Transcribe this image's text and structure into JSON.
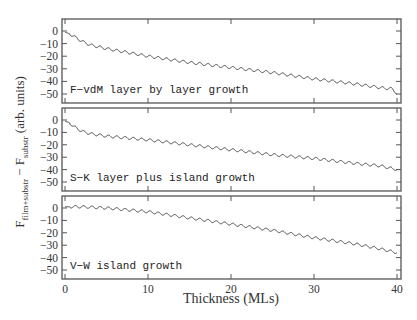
{
  "chart_data": {
    "type": "line",
    "layout": "three vertically stacked panels sharing x-axis",
    "xlabel": "Thickness (MLs)",
    "ylabel": "F_film+substr − F_substr (arb. units)",
    "ylabel_parts": {
      "main_F1": "F",
      "sub1": "film+substr",
      "minus": " − ",
      "main_F2": "F",
      "sub2": "substr",
      "units": " (arb. units)"
    },
    "xlim": [
      0,
      40
    ],
    "ylim": [
      -55,
      8
    ],
    "x_ticks": [
      0,
      10,
      20,
      30,
      40
    ],
    "y_ticks": [
      0,
      -10,
      -20,
      -30,
      -40,
      -50
    ],
    "grid": false,
    "legend": null,
    "line_color": "#333333",
    "panels": [
      {
        "label": "F−vdM layer by layer growth",
        "series_name": "Frank-van der Merwe",
        "oscillation_period_ML": 1,
        "oscillation_amplitude": 2,
        "x": [
          0,
          0.5,
          1,
          2,
          3,
          5,
          10,
          15,
          20,
          25,
          30,
          35,
          38,
          39.5,
          40
        ],
        "values": [
          -1,
          -2,
          -4,
          -8,
          -11,
          -14,
          -20,
          -25,
          -29,
          -33,
          -38,
          -42,
          -45,
          -46,
          -50
        ]
      },
      {
        "label": "S−K layer plus island growth",
        "series_name": "Stranski-Krastanov",
        "oscillation_period_ML": 1,
        "oscillation_amplitude": 2,
        "x": [
          0,
          0.5,
          1,
          2,
          3,
          5,
          10,
          15,
          20,
          25,
          30,
          35,
          38,
          40
        ],
        "values": [
          -1,
          -2,
          -5,
          -9,
          -11,
          -13,
          -16,
          -20,
          -24,
          -28,
          -31,
          -35,
          -37,
          -40
        ]
      },
      {
        "label": "V−W island growth",
        "series_name": "Volmer-Weber",
        "oscillation_period_ML": 1,
        "oscillation_amplitude": 2,
        "x": [
          0,
          2,
          5,
          10,
          15,
          20,
          25,
          30,
          35,
          38,
          40
        ],
        "values": [
          1,
          1,
          0,
          -3,
          -8,
          -13,
          -18,
          -24,
          -29,
          -33,
          -36
        ]
      }
    ]
  }
}
